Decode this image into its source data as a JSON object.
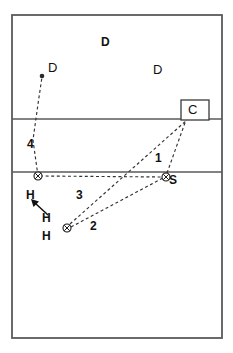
{
  "diagram": {
    "court": {
      "outline": {
        "x": 12,
        "y": 15,
        "width": 210,
        "height": 323
      },
      "attack_line_y": 119,
      "center_line_y": 172,
      "line_color": "#5a5a5a"
    },
    "colors": {
      "line": "#5a5a5a",
      "path": "#333333",
      "marker": "#1a1a1a",
      "text": "#111111"
    },
    "players": [
      {
        "label": "D",
        "name": "defender-top-left",
        "x": 53,
        "y": 69,
        "style": "role",
        "marker": "dot",
        "marker_x": 42,
        "marker_y": 76
      },
      {
        "label": "D",
        "name": "defender-top-center",
        "x": 105,
        "y": 43,
        "style": "role-bold",
        "marker": "none"
      },
      {
        "label": "D",
        "name": "defender-top-right",
        "x": 157,
        "y": 71,
        "style": "role",
        "marker": "none"
      },
      {
        "label": "C",
        "name": "coach-position",
        "x": 191,
        "y": 115,
        "style": "c",
        "marker": "box"
      },
      {
        "label": "S",
        "name": "setter-position",
        "x": 172,
        "y": 182,
        "style": "s",
        "marker": "circle-x",
        "marker_x": 166,
        "marker_y": 177
      },
      {
        "label": "H",
        "name": "hitter-left",
        "x": 29,
        "y": 195,
        "style": "h",
        "marker": "circle-x",
        "marker_x": 38,
        "marker_y": 176
      },
      {
        "label": "H",
        "name": "hitter-arrow-target",
        "x": 45,
        "y": 219,
        "style": "h",
        "marker": "none"
      },
      {
        "label": "H",
        "name": "hitter-center",
        "x": 45,
        "y": 237,
        "style": "h",
        "marker": "circle-x",
        "marker_x": 67,
        "marker_y": 228
      }
    ],
    "paths": [
      {
        "name": "path-1-setter-to-coach",
        "number": "1",
        "from_x": 166,
        "from_y": 177,
        "to_x": 188,
        "to_y": 119,
        "label_x": 157,
        "label_y": 158
      },
      {
        "name": "path-2-hitter-to-setter",
        "number": "2",
        "from_x": 67,
        "from_y": 228,
        "to_x": 166,
        "to_y": 177,
        "label_x": 92,
        "label_y": 227
      },
      {
        "name": "path-3-setter-to-hitter-left",
        "number": "3",
        "from_x": 38,
        "from_y": 176,
        "to_x": 166,
        "to_y": 177,
        "label_x": 78,
        "label_y": 196
      },
      {
        "name": "path-4-hitter-to-defender",
        "number": "4",
        "from_x": 38,
        "from_y": 176,
        "to_x": 42,
        "to_y": 76,
        "label_x": 29,
        "label_y": 145
      },
      {
        "name": "path-hitter-diagonal-to-coach",
        "number": "",
        "from_x": 67,
        "from_y": 228,
        "to_x": 188,
        "to_y": 119,
        "label_x": 0,
        "label_y": 0
      }
    ],
    "arrows": [
      {
        "name": "movement-arrow-hitter",
        "from_x": 48,
        "from_y": 214,
        "to_x": 33,
        "to_y": 201
      }
    ],
    "box": {
      "name": "coach-box",
      "x": 181,
      "y": 100,
      "width": 28,
      "height": 20
    }
  }
}
